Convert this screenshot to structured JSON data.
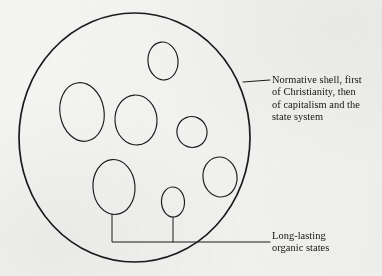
{
  "figure": {
    "name": "normative-shell-diagram",
    "background_color": "#f4f4f3",
    "ink_color": "#1b1b1b"
  },
  "shell": {
    "name": "normative-shell-circle",
    "shape": "circle",
    "center_x": 134.5,
    "center_y": 137.5,
    "radius_x": 115.5,
    "radius_y": 124.5
  },
  "labels": {
    "shell": {
      "text": "Normative shell, first\nof Christianity, then\nof capitalism and the\nstate system",
      "lines": [
        "Normative shell, first",
        "of Christianity, then",
        "of capitalism and the",
        "state system"
      ]
    },
    "states": {
      "text": "Long-lasting\norganic states",
      "lines": [
        "Long-lasting",
        "organic states"
      ]
    }
  },
  "organic_states": [
    {
      "id": "state-top",
      "cx": 163,
      "cy": 61,
      "rx": 15,
      "ry": 19,
      "rotation": -6
    },
    {
      "id": "state-left",
      "cx": 82,
      "cy": 112,
      "rx": 22,
      "ry": 29.5,
      "rotation": -10
    },
    {
      "id": "state-center",
      "cx": 136,
      "cy": 120,
      "rx": 21,
      "ry": 25,
      "rotation": -4
    },
    {
      "id": "state-right-small",
      "cx": 192,
      "cy": 132,
      "rx": 15,
      "ry": 15.5,
      "rotation": -22
    },
    {
      "id": "state-bottom-left",
      "cx": 114,
      "cy": 187,
      "rx": 21,
      "ry": 27.5,
      "rotation": -4
    },
    {
      "id": "state-bottom-small",
      "cx": 173,
      "cy": 202,
      "rx": 11.5,
      "ry": 15,
      "rotation": -3
    },
    {
      "id": "state-bottom-right",
      "cx": 220,
      "cy": 177,
      "rx": 17,
      "ry": 20,
      "rotation": -8
    }
  ],
  "leaders": {
    "shell": {
      "from_x": 243,
      "from_y": 82,
      "to_x": 270,
      "to_y": 80
    },
    "states": {
      "stem_left_x": 112,
      "stem_left_y": 214,
      "stem_mid_x": 173,
      "stem_mid_y": 217,
      "bar_y": 242,
      "bar_end_x": 270
    }
  }
}
